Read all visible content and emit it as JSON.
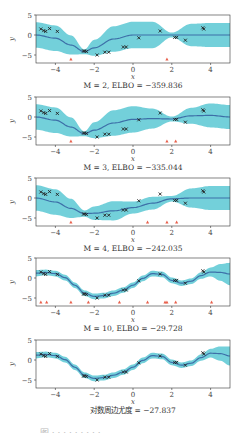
{
  "figure": {
    "caption_partial": "图 · · · · · · · · ·",
    "colors": {
      "band": "#5bc8d3",
      "mean": "#3d6fa8",
      "points": "#222222",
      "inducing": "#e8604c",
      "axes": "#333333"
    }
  },
  "chart_data": [
    {
      "type": "line",
      "title": "M = 2, ELBO = −359.836",
      "xlabel": "x",
      "ylabel": "y",
      "xlim": [
        -5,
        5
      ],
      "ylim": [
        -7,
        5
      ],
      "xticks": [
        -4,
        -2,
        0,
        2,
        4
      ],
      "yticks": [
        -5,
        0,
        5
      ],
      "mean": {
        "x": [
          -5,
          -4,
          -3.2,
          -2.5,
          -2,
          -1,
          0,
          1,
          2,
          3,
          4,
          5
        ],
        "y": [
          0,
          -0.8,
          -2.5,
          -4.2,
          -3.2,
          -1,
          0,
          0,
          0,
          0,
          0,
          0
        ]
      },
      "band_halfwidth": [
        3.2,
        3.2,
        2.4,
        0.6,
        2,
        3.2,
        3.3,
        3.3,
        0.6,
        2.8,
        3,
        3
      ],
      "inducing_x": [
        -3.2,
        1.75
      ]
    },
    {
      "type": "line",
      "title": "M = 3, ELBO = −335.044",
      "xlabel": "x",
      "ylabel": "y",
      "xlim": [
        -5,
        5
      ],
      "ylim": [
        -7,
        5
      ],
      "xticks": [
        -4,
        -2,
        0,
        2,
        4
      ],
      "yticks": [
        -5,
        0,
        5
      ],
      "mean": {
        "x": [
          -5,
          -4,
          -3.2,
          -2.5,
          -2,
          -1,
          0,
          1,
          2,
          3,
          4,
          5
        ],
        "y": [
          0,
          -0.8,
          -2.5,
          -4.2,
          -3.3,
          -1.5,
          -0.6,
          -0.4,
          -0.5,
          0.3,
          0.4,
          0
        ]
      },
      "band_halfwidth": [
        3.2,
        3.2,
        2.4,
        0.6,
        2,
        3.2,
        3.3,
        2.5,
        0.6,
        2,
        3,
        3
      ],
      "inducing_x": [
        -3.2,
        1.75,
        2.2
      ]
    },
    {
      "type": "line",
      "title": "M = 4, ELBO = −242.035",
      "xlabel": "x",
      "ylabel": "y",
      "xlim": [
        -5,
        5
      ],
      "ylim": [
        -7,
        5
      ],
      "xticks": [
        -4,
        -2,
        0,
        2,
        4
      ],
      "yticks": [
        -5,
        0,
        5
      ],
      "mean": {
        "x": [
          -5,
          -4,
          -3.2,
          -2.5,
          -2,
          -1,
          0,
          1,
          2,
          3,
          4,
          5
        ],
        "y": [
          0,
          -1,
          -2.6,
          -3.9,
          -3.8,
          -3.2,
          -2.4,
          -1.3,
          -0.2,
          0,
          0,
          0
        ]
      },
      "band_halfwidth": [
        3.2,
        3.2,
        2.4,
        0.8,
        1.7,
        2.4,
        1.5,
        1.6,
        0.7,
        2.4,
        3,
        3
      ],
      "inducing_x": [
        -3.2,
        0.75,
        1.75,
        2.25
      ]
    },
    {
      "type": "line",
      "title": "M = 10, ELBO = −29.728",
      "xlabel": "x",
      "ylabel": "y",
      "xlim": [
        -5,
        5
      ],
      "ylim": [
        -7,
        5
      ],
      "xticks": [
        -4,
        -2,
        0,
        2,
        4
      ],
      "yticks": [
        -5,
        0,
        5
      ],
      "mean": {
        "x": [
          -5,
          -4.5,
          -4,
          -3.5,
          -3,
          -2.5,
          -2,
          -1.5,
          -1,
          -0.5,
          0,
          0.5,
          1,
          1.5,
          2,
          2.5,
          3,
          3.5,
          4,
          4.5,
          5
        ],
        "y": [
          1.2,
          1.4,
          1.1,
          0.1,
          -1.8,
          -3.8,
          -4.6,
          -4.4,
          -3.8,
          -3,
          -1.8,
          -0.1,
          1.1,
          0.9,
          -0.6,
          -1.3,
          -0.8,
          0.6,
          1.5,
          1.4,
          1.0
        ]
      },
      "band_halfwidth": [
        0.8,
        0.7,
        0.7,
        0.7,
        0.7,
        0.7,
        0.7,
        0.7,
        0.7,
        0.7,
        0.7,
        0.7,
        0.7,
        0.7,
        0.7,
        0.7,
        0.7,
        0.8,
        1.1,
        2.1,
        2.8
      ],
      "inducing_x": [
        -4.75,
        -4.45,
        -3.2,
        -2.3,
        -0.7,
        0.75,
        1.65,
        1.75,
        2.2,
        4.05
      ]
    },
    {
      "type": "line",
      "title": "对数周边尤度 = −27.837",
      "xlabel": "x",
      "ylabel": "y",
      "xlim": [
        -5,
        5
      ],
      "ylim": [
        -7,
        5
      ],
      "xticks": [
        -4,
        -2,
        0,
        2,
        4
      ],
      "yticks": [
        -5,
        0,
        5
      ],
      "mean": {
        "x": [
          -5,
          -4.5,
          -4,
          -3.5,
          -3,
          -2.5,
          -2,
          -1.5,
          -1,
          -0.5,
          0,
          0.5,
          1,
          1.5,
          2,
          2.5,
          3,
          3.5,
          4,
          4.5,
          5
        ],
        "y": [
          1.2,
          1.4,
          1.1,
          0.1,
          -1.8,
          -3.8,
          -4.6,
          -4.4,
          -3.8,
          -3,
          -1.8,
          -0.1,
          1.1,
          0.9,
          -0.6,
          -1.3,
          -0.8,
          0.6,
          1.7,
          1.6,
          1.0
        ]
      },
      "band_halfwidth": [
        0.8,
        0.7,
        0.7,
        0.7,
        0.7,
        0.7,
        0.7,
        0.7,
        0.7,
        0.7,
        0.7,
        0.7,
        0.7,
        0.7,
        0.7,
        0.7,
        0.7,
        0.8,
        1.1,
        1.8,
        2.4
      ],
      "inducing_x": []
    }
  ],
  "observations": {
    "x": [
      -4.75,
      -4.6,
      -4.5,
      -4.3,
      -3.9,
      -2.55,
      -2.5,
      -2.4,
      -1.85,
      -1.45,
      -1.25,
      -0.5,
      -0.35,
      0.3,
      1.4,
      2.15,
      2.25,
      2.7,
      3.6,
      3.65
    ],
    "y": [
      1.5,
      1.1,
      0.9,
      1.6,
      0.9,
      -4.0,
      -4.0,
      -4.1,
      -5.0,
      -4.3,
      -4.3,
      -3.0,
      -3.0,
      -0.7,
      1.0,
      -0.6,
      -0.6,
      -1.3,
      1.8,
      1.5
    ]
  }
}
